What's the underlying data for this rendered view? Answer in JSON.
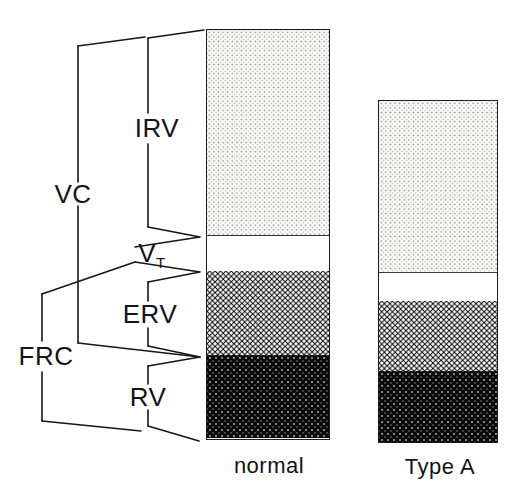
{
  "chart_data": {
    "type": "bar",
    "variant": "stacked",
    "title": "",
    "categories": [
      "normal",
      "Type A"
    ],
    "series": [
      {
        "name": "IRV",
        "pattern": "light-dot-screen",
        "heights_px": [
          206,
          172
        ]
      },
      {
        "name": "VT",
        "pattern": "plain-white",
        "heights_px": [
          35,
          28
        ]
      },
      {
        "name": "ERV",
        "pattern": "dark-checkerboard",
        "heights_px": [
          84,
          70
        ]
      },
      {
        "name": "RV",
        "pattern": "black-speckled",
        "heights_px": [
          83,
          71
        ]
      }
    ],
    "bracket_annotations": [
      {
        "label": "IRV",
        "covers": [
          "IRV"
        ]
      },
      {
        "label": "VT",
        "covers": [
          "VT"
        ]
      },
      {
        "label": "ERV",
        "covers": [
          "ERV"
        ]
      },
      {
        "label": "RV",
        "covers": [
          "RV"
        ]
      },
      {
        "label": "VC",
        "covers": [
          "IRV",
          "VT",
          "ERV"
        ]
      },
      {
        "label": "FRC",
        "covers": [
          "ERV",
          "RV"
        ]
      }
    ],
    "axes": "none",
    "legend": "none",
    "colors": {
      "ink": "#161616",
      "background": "#ffffff"
    }
  },
  "annotations": {
    "vc": "VC",
    "irv": "IRV",
    "vt_main": "V",
    "vt_sub": "T",
    "erv": "ERV",
    "rv": "RV",
    "frc": "FRC"
  }
}
